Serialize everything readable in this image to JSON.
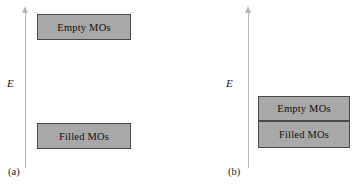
{
  "figure": {
    "background_color": "#ffffff",
    "band_fill_color": "#a8a8a8",
    "band_border_color": "#4a4a4a",
    "axis_color": "#b9b9b9",
    "text_color": "#111111"
  },
  "panel_a": {
    "caption": "(a)",
    "axis_label": "E",
    "axis_name": "energy-axis",
    "bands": [
      {
        "label": "Empty MOs",
        "position": "upper"
      },
      {
        "label": "Filled MOs",
        "position": "lower"
      }
    ]
  },
  "panel_b": {
    "caption": "(b)",
    "axis_label": "E",
    "axis_name": "energy-axis",
    "bands": [
      {
        "label": "Empty MOs",
        "position": "upper"
      },
      {
        "label": "Filled MOs",
        "position": "lower"
      }
    ]
  }
}
